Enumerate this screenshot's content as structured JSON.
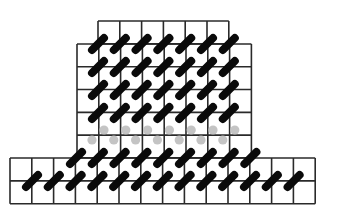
{
  "diagram": {
    "type": "lattice-grid-with-dimers",
    "colors": {
      "background": "#ffffff",
      "grid_line": "#2a2a2a",
      "dimer_dark": "#0a0a0a",
      "dimer_faded": "#c4c4c4"
    },
    "cell_size": 21.8,
    "blocks": [
      {
        "name": "top-row",
        "x": 98,
        "y": 21,
        "cols": 6,
        "rows": 1
      },
      {
        "name": "upper-block",
        "x": 77,
        "y": 44,
        "cols": 8,
        "rows": 5
      },
      {
        "name": "bottom-block",
        "x": 10,
        "y": 158,
        "cols": 14,
        "rows": 2
      }
    ],
    "dimer_rows": [
      {
        "y": 44,
        "x_start": 98,
        "count": 7,
        "style": "dark"
      },
      {
        "y": 67,
        "x_start": 98,
        "count": 7,
        "style": "dark"
      },
      {
        "y": 90,
        "x_start": 98,
        "count": 7,
        "style": "dark"
      },
      {
        "y": 113,
        "x_start": 98,
        "count": 7,
        "style": "dark"
      },
      {
        "y": 135,
        "x_start": 98,
        "count": 7,
        "style": "faded"
      },
      {
        "y": 158,
        "x_start": 76,
        "count": 9,
        "style": "dark"
      },
      {
        "y": 181,
        "x_start": 32,
        "count": 13,
        "style": "dark"
      }
    ]
  }
}
